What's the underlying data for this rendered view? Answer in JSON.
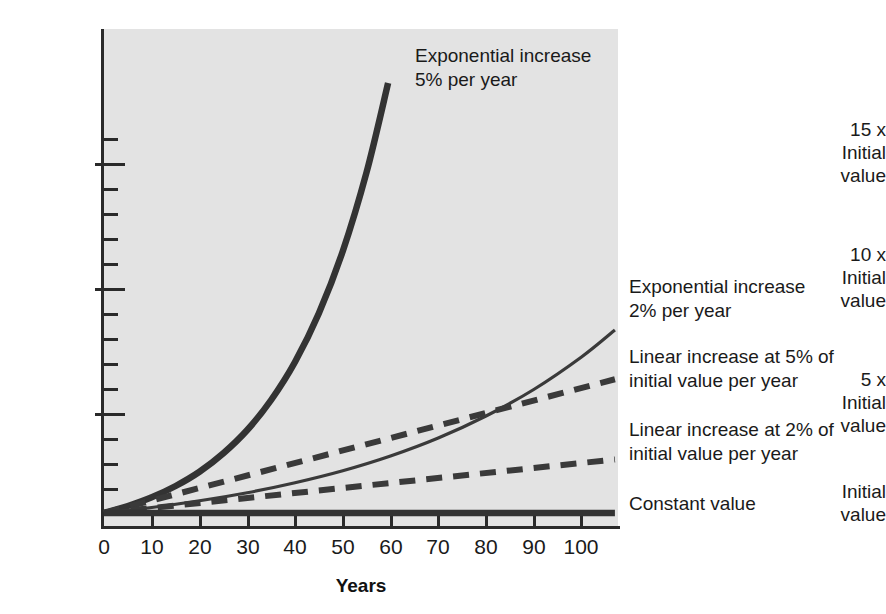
{
  "chart_data": {
    "type": "line",
    "title": "",
    "xlabel": "Years",
    "ylabel": "",
    "xlim": [
      0,
      108
    ],
    "ylim": [
      0,
      19.8
    ],
    "grid": false,
    "legend_position": "inline-annotations",
    "x_ticks": [
      0,
      10,
      20,
      30,
      40,
      50,
      60,
      70,
      80,
      90,
      100
    ],
    "x_tick_labels": [
      "0",
      "10",
      "20",
      "30",
      "40",
      "50",
      "60",
      "70",
      "80",
      "90",
      "100"
    ],
    "y_major_ticks": [
      1,
      5,
      10,
      15
    ],
    "y_major_tick_labels": [
      "Initial value",
      "5 x Initial value",
      "10 x Initial value",
      "15 x Initial value"
    ],
    "y_minor_ticks": [
      2.3,
      3.6,
      6.3,
      7.6,
      8.8,
      11.3,
      12.6,
      13.8,
      16.3,
      17.6,
      18.8
    ],
    "series": [
      {
        "name": "Exponential increase 5% per year",
        "style": "solid-thick",
        "color": "#333333",
        "x": [
          0,
          5,
          10,
          15,
          20,
          25,
          30,
          35,
          40,
          45,
          50,
          55,
          59.5
        ],
        "values": [
          1.0,
          1.28,
          1.63,
          2.08,
          2.65,
          3.39,
          4.32,
          5.52,
          7.04,
          8.99,
          11.47,
          14.64,
          18.2
        ]
      },
      {
        "name": "Exponential increase 2% per year",
        "style": "solid-thin",
        "color": "#3a3a3a",
        "x": [
          0,
          10,
          20,
          30,
          40,
          50,
          60,
          70,
          80,
          90,
          100,
          107
        ],
        "values": [
          1.0,
          1.22,
          1.49,
          1.81,
          2.21,
          2.69,
          3.28,
          4.0,
          4.88,
          5.94,
          7.24,
          8.32
        ]
      },
      {
        "name": "Linear increase at 5% of initial value per year",
        "style": "dashed",
        "color": "#3a3a3a",
        "x": [
          0,
          107
        ],
        "values": [
          1.0,
          6.35
        ]
      },
      {
        "name": "Linear increase at 2% of initial value per year",
        "style": "dashed",
        "color": "#3a3a3a",
        "x": [
          0,
          107
        ],
        "values": [
          1.0,
          3.14
        ]
      },
      {
        "name": "Constant value",
        "style": "solid-thick",
        "color": "#333333",
        "x": [
          0,
          107
        ],
        "values": [
          1.0,
          1.0
        ]
      }
    ]
  },
  "axis": {
    "x_title": "Years",
    "x_tick_labels": [
      "0",
      "10",
      "20",
      "30",
      "40",
      "50",
      "60",
      "70",
      "80",
      "90",
      "100"
    ],
    "y_labels": [
      {
        "line1": "15 x",
        "line2": "Initial",
        "line3": "value"
      },
      {
        "line1": "10 x",
        "line2": "Initial",
        "line3": "value"
      },
      {
        "line1": "5 x",
        "line2": "Initial",
        "line3": "value"
      },
      {
        "line1": "Initial",
        "line2": "value",
        "line3": ""
      }
    ]
  },
  "annotations": {
    "exp5": {
      "line1": "Exponential increase",
      "line2": "5% per year"
    },
    "exp2": {
      "line1": "Exponential increase",
      "line2": "2% per year"
    },
    "lin5": {
      "line1": "Linear increase at 5% of",
      "line2": "initial value per year"
    },
    "lin2": {
      "line1": "Linear increase at 2% of",
      "line2": "initial value per year"
    },
    "constant": {
      "line1": "Constant value",
      "line2": ""
    }
  },
  "colors": {
    "plot_background": "#e3e3e3",
    "axis": "#2a2a2a",
    "curve": "#333333",
    "text": "#1a1a1a"
  }
}
